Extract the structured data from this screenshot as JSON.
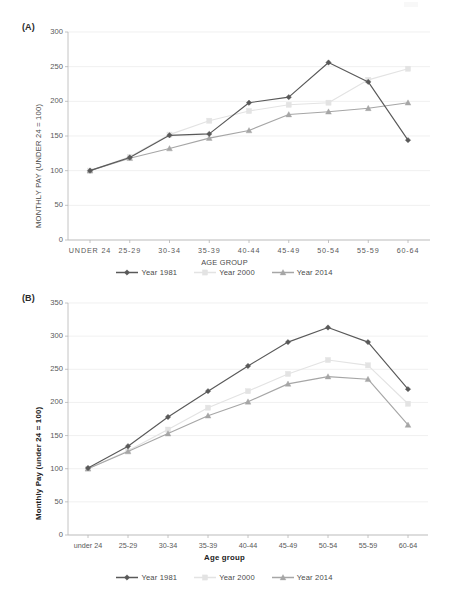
{
  "colors": {
    "series_1981": "#595959",
    "series_2000": "#e3e3e3",
    "series_2014": "#a6a6a6",
    "gridline": "#e9e9e9",
    "axis": "#b5b5b5",
    "text": "#595959"
  },
  "panel_a": {
    "label": "(A)"
  },
  "panel_b": {
    "label": "(B)"
  },
  "chart_data": [
    {
      "type": "line",
      "panel": "(A)",
      "title": "",
      "xlabel": "AGE GROUP",
      "ylabel": "MONTHLY PAY (UNDER 24 = 100)",
      "categories": [
        "UNDER 24",
        "25-29",
        "30-34",
        "35-39",
        "40-44",
        "45-49",
        "50-54",
        "55-59",
        "60-64"
      ],
      "ylim": [
        0,
        300
      ],
      "yticks": [
        0,
        50,
        100,
        150,
        200,
        250,
        300
      ],
      "grid": true,
      "legend_position": "bottom",
      "series": [
        {
          "name": "Year 1981",
          "color": "#595959",
          "marker": "diamond",
          "values": [
            100,
            119,
            151,
            153,
            198,
            206,
            256,
            228,
            144
          ]
        },
        {
          "name": "Year 2000",
          "color": "#e3e3e3",
          "marker": "square",
          "values": [
            100,
            120,
            152,
            172,
            186,
            195,
            198,
            231,
            247
          ]
        },
        {
          "name": "Year 2014",
          "color": "#a6a6a6",
          "marker": "triangle",
          "values": [
            100,
            118,
            132,
            147,
            158,
            181,
            185,
            190,
            198
          ]
        }
      ]
    },
    {
      "type": "line",
      "panel": "(B)",
      "title": "",
      "xlabel": "Age group",
      "ylabel": "Monthly Pay (under 24 = 100)",
      "categories": [
        "under 24",
        "25-29",
        "30-34",
        "35-39",
        "40-44",
        "45-49",
        "50-54",
        "55-59",
        "60-64"
      ],
      "ylim": [
        0,
        350
      ],
      "yticks": [
        0,
        50,
        100,
        150,
        200,
        250,
        300,
        350
      ],
      "grid": true,
      "legend_position": "bottom",
      "series": [
        {
          "name": "Year 1981",
          "color": "#595959",
          "marker": "diamond",
          "values": [
            101,
            134,
            178,
            217,
            255,
            291,
            313,
            291,
            220
          ]
        },
        {
          "name": "Year 2000",
          "color": "#e3e3e3",
          "marker": "square",
          "values": [
            100,
            127,
            159,
            192,
            217,
            243,
            264,
            256,
            198
          ]
        },
        {
          "name": "Year 2014",
          "color": "#a6a6a6",
          "marker": "triangle",
          "values": [
            100,
            126,
            153,
            180,
            201,
            228,
            239,
            235,
            166
          ]
        }
      ]
    }
  ]
}
